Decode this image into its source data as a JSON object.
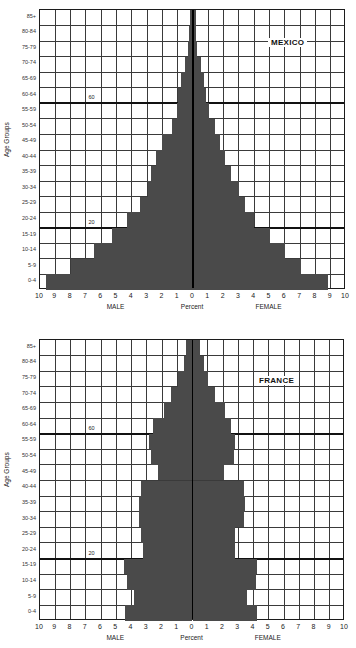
{
  "chart_data": [
    {
      "type": "bar",
      "subtype": "population-pyramid",
      "title": "MEXICO",
      "xlabel": "Percent",
      "ylabel": "Age Groups",
      "x_left_label": "MALE",
      "x_right_label": "FEMALE",
      "xlim": [
        -10,
        10
      ],
      "x_ticks": [
        "10",
        "9",
        "8",
        "7",
        "6",
        "5",
        "4",
        "3",
        "2",
        "1",
        "0",
        "1",
        "2",
        "3",
        "4",
        "5",
        "6",
        "7",
        "8",
        "9",
        "10"
      ],
      "grid": true,
      "markers": [
        "60",
        "20"
      ],
      "categories": [
        "85+",
        "80-84",
        "75-79",
        "70-74",
        "65-69",
        "60-64",
        "55-59",
        "50-54",
        "45-49",
        "40-44",
        "35-39",
        "30-34",
        "25-29",
        "20-24",
        "15-19",
        "10-14",
        "5-9",
        "0-4"
      ],
      "series": [
        {
          "name": "MALE",
          "values": [
            0.2,
            0.25,
            0.35,
            0.5,
            0.8,
            0.95,
            1.05,
            1.4,
            2.0,
            2.45,
            2.75,
            2.95,
            3.45,
            4.3,
            5.3,
            6.5,
            8.0,
            9.6
          ]
        },
        {
          "name": "FEMALE",
          "values": [
            0.2,
            0.2,
            0.25,
            0.5,
            0.75,
            0.85,
            1.05,
            1.45,
            1.75,
            2.1,
            2.5,
            3.0,
            3.4,
            4.0,
            5.0,
            6.0,
            7.05,
            8.8
          ]
        }
      ]
    },
    {
      "type": "bar",
      "subtype": "population-pyramid",
      "title": "FRANCE",
      "xlabel": "Percent",
      "ylabel": "Age Groups",
      "x_left_label": "MALE",
      "x_right_label": "FEMALE",
      "xlim": [
        -10,
        10
      ],
      "x_ticks": [
        "10",
        "9",
        "8",
        "7",
        "6",
        "5",
        "4",
        "3",
        "2",
        "1",
        "0",
        "1",
        "2",
        "3",
        "4",
        "5",
        "6",
        "7",
        "8",
        "9",
        "10"
      ],
      "grid": true,
      "markers": [
        "60",
        "20"
      ],
      "categories": [
        "85+",
        "80-84",
        "75-79",
        "70-74",
        "65-69",
        "60-64",
        "55-59",
        "50-54",
        "45-49",
        "40-44",
        "35-39",
        "30-34",
        "25-29",
        "20-24",
        "15-19",
        "10-14",
        "5-9",
        "0-4"
      ],
      "series": [
        {
          "name": "MALE",
          "values": [
            0.4,
            0.55,
            0.95,
            1.4,
            1.85,
            2.6,
            2.85,
            2.75,
            2.25,
            3.4,
            3.5,
            3.5,
            3.4,
            3.25,
            4.5,
            4.3,
            3.85,
            4.45
          ]
        },
        {
          "name": "FEMALE",
          "values": [
            0.5,
            0.75,
            1.0,
            1.5,
            2.1,
            2.5,
            2.8,
            2.75,
            2.05,
            3.4,
            3.45,
            3.35,
            2.8,
            2.8,
            4.2,
            4.15,
            3.6,
            4.2
          ]
        }
      ]
    }
  ],
  "charts": [
    {
      "title": "MEXICO",
      "ylabel": "Age Groups",
      "xlabel": "Percent",
      "male": "MALE",
      "female": "FEMALE",
      "marker60": "60",
      "marker20": "20"
    },
    {
      "title": "FRANCE",
      "ylabel": "Age Groups",
      "xlabel": "Percent",
      "male": "MALE",
      "female": "FEMALE",
      "marker60": "60",
      "marker20": "20"
    }
  ],
  "colors": {
    "bar": "#4a4a4a",
    "grid": "#3a3a3a",
    "border": "#1c1c1c"
  }
}
